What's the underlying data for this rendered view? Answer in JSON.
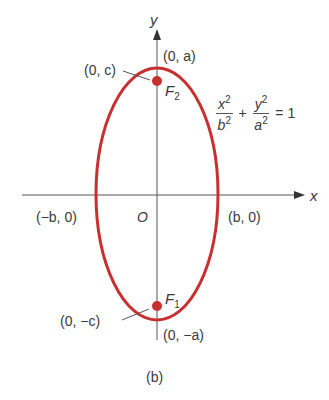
{
  "figure": {
    "caption": "(b)",
    "colors": {
      "ellipse": "#c8302f",
      "axis": "#555555",
      "focus": "#c8302f"
    },
    "axes": {
      "x_label": "x",
      "y_label": "y",
      "origin_label": "O"
    },
    "vertices": {
      "top": "(0, a)",
      "bottom": "(0, −a)",
      "left": "(−b, 0)",
      "right": "(b, 0)"
    },
    "foci": {
      "upper": {
        "name": "F",
        "sub": "2",
        "coord": "(0, c)"
      },
      "lower": {
        "name": "F",
        "sub": "1",
        "coord": "(0, −c)"
      }
    },
    "equation": {
      "term1_num": "x",
      "term1_den": "b",
      "term2_num": "y",
      "term2_den": "a",
      "exp": "2",
      "plus": "+",
      "equals": "= 1"
    }
  }
}
